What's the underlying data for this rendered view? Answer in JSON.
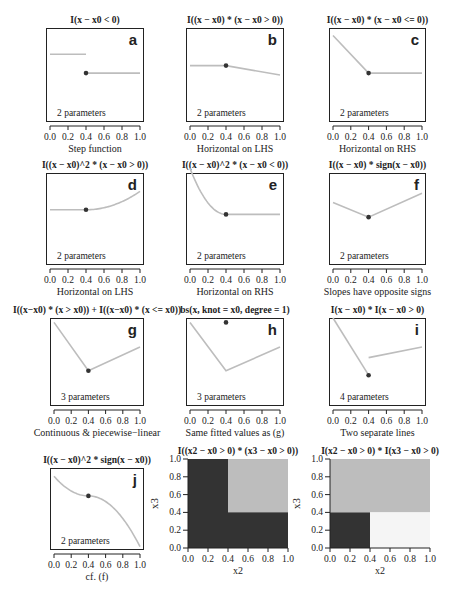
{
  "chart_data": [
    {
      "id": "a",
      "type": "line",
      "title": "I(x − x0 < 0)",
      "letter": "a",
      "params": "2 parameters",
      "xlabel": "Step function",
      "segments": [
        [
          [
            0.0,
            0.72
          ],
          [
            0.4,
            0.72
          ]
        ],
        [
          [
            0.4,
            0.52
          ],
          [
            1.0,
            0.52
          ]
        ]
      ],
      "knot": [
        0.4,
        0.52
      ],
      "xticks": [
        "0.0",
        "0.2",
        "0.4",
        "0.6",
        "0.8",
        "1.0"
      ],
      "xlim": [
        0,
        1
      ]
    },
    {
      "id": "b",
      "type": "line",
      "title": "I((x − x0) * (x − x0 > 0))",
      "letter": "b",
      "params": "2 parameters",
      "xlabel": "Horizontal on LHS",
      "segments": [
        [
          [
            0.0,
            0.6
          ],
          [
            0.4,
            0.6
          ],
          [
            1.0,
            0.5
          ]
        ]
      ],
      "knot": [
        0.4,
        0.6
      ],
      "xticks": [
        "0.0",
        "0.2",
        "0.4",
        "0.6",
        "0.8",
        "1.0"
      ],
      "xlim": [
        0,
        1
      ]
    },
    {
      "id": "c",
      "type": "line",
      "title": "I((x − x0) * (x − x0 <= 0))",
      "letter": "c",
      "params": "2 parameters",
      "xlabel": "Horizontal on RHS",
      "segments": [
        [
          [
            0.0,
            0.92
          ],
          [
            0.4,
            0.52
          ],
          [
            1.0,
            0.52
          ]
        ]
      ],
      "knot": [
        0.4,
        0.52
      ],
      "xticks": [
        "0.0",
        "0.2",
        "0.4",
        "0.6",
        "0.8",
        "1.0"
      ],
      "xlim": [
        0,
        1
      ]
    },
    {
      "id": "d",
      "type": "line",
      "title": "I((x − x0)^2 * (x − x0 > 0))",
      "letter": "d",
      "params": "2 parameters",
      "xlabel": "Horizontal on LHS",
      "curve": "quad_right",
      "knot": [
        0.4,
        0.6
      ],
      "end_y": 0.8,
      "xticks": [
        "0.0",
        "0.2",
        "0.4",
        "0.6",
        "0.8",
        "1.0"
      ],
      "xlim": [
        0,
        1
      ]
    },
    {
      "id": "e",
      "type": "line",
      "title": "I((x − x0)^2 * (x − x0 < 0))",
      "letter": "e",
      "params": "2 parameters",
      "xlabel": "Horizontal on RHS",
      "curve": "quad_left",
      "knot": [
        0.4,
        0.55
      ],
      "start_y": 1.05,
      "xticks": [
        "0.0",
        "0.2",
        "0.4",
        "0.6",
        "0.8",
        "1.0"
      ],
      "xlim": [
        0,
        1
      ]
    },
    {
      "id": "f",
      "type": "line",
      "title": "I((x − x0) * sign(x − x0))",
      "letter": "f",
      "params": "2 parameters",
      "xlabel": "Slopes have opposite signs",
      "segments": [
        [
          [
            0.0,
            0.68
          ],
          [
            0.4,
            0.52
          ],
          [
            1.0,
            0.78
          ]
        ]
      ],
      "knot": [
        0.4,
        0.52
      ],
      "xticks": [
        "0.0",
        "0.2",
        "0.4",
        "0.6",
        "0.8",
        "1.0"
      ],
      "xlim": [
        0,
        1
      ]
    },
    {
      "id": "g",
      "type": "line",
      "title": "I((x−x0) * (x >  x0)) + I((x−x0) * (x <= x0))",
      "letter": "g",
      "params": "3 parameters",
      "xlabel": "Continuous & piecewise−linear",
      "segments": [
        [
          [
            0.0,
            0.95
          ],
          [
            0.4,
            0.4
          ],
          [
            1.0,
            0.67
          ]
        ]
      ],
      "knot": [
        0.4,
        0.4
      ],
      "xticks": [
        "0.0",
        "0.2",
        "0.4",
        "0.6",
        "0.8",
        "1.0"
      ],
      "xlim": [
        0,
        1
      ]
    },
    {
      "id": "h",
      "type": "line",
      "title": "bs(x, knot = x0, degree = 1)",
      "letter": "h",
      "params": "3 parameters",
      "xlabel": "Same fitted values as (g)",
      "segments": [
        [
          [
            0.0,
            0.95
          ],
          [
            0.4,
            0.4
          ],
          [
            1.0,
            0.67
          ]
        ]
      ],
      "knot": [
        0.4,
        0.95
      ],
      "xticks": [
        "0.0",
        "0.2",
        "0.4",
        "0.6",
        "0.8",
        "1.0"
      ],
      "xlim": [
        0,
        1
      ]
    },
    {
      "id": "i",
      "type": "line",
      "title": "I(x − x0) * I(x − x0 > 0)",
      "letter": "i",
      "params": "4 parameters",
      "xlabel": "Two separate lines",
      "segments": [
        [
          [
            0.0,
            1.0
          ],
          [
            0.4,
            0.35
          ]
        ],
        [
          [
            0.4,
            0.55
          ],
          [
            1.0,
            0.67
          ]
        ]
      ],
      "knot": [
        0.4,
        0.35
      ],
      "xticks": [
        "0.0",
        "0.2",
        "0.4",
        "0.6",
        "0.8",
        "1.0"
      ],
      "xlim": [
        0,
        1
      ]
    },
    {
      "id": "j",
      "type": "line",
      "title": "I((x − x0)^2 * sign(x − x0))",
      "letter": "j",
      "params": "2 parameters",
      "xlabel": "cf. (f)",
      "curve": "signed_quad",
      "knot": [
        0.4,
        0.66
      ],
      "start_y": 0.9,
      "end_y": 0.04,
      "xticks": [
        "0.0",
        "0.2",
        "0.4",
        "0.6",
        "0.8",
        "1.0"
      ],
      "xlim": [
        0,
        1
      ]
    },
    {
      "id": "k",
      "type": "heatmap",
      "title": "I((x2 − x0 > 0) * (x3 − x0 > 0))",
      "letter": "k",
      "xlabel": "x2",
      "ylabel": "x3",
      "regions": [
        {
          "x": [
            0,
            1
          ],
          "y": [
            0,
            1
          ],
          "color": "#333333"
        },
        {
          "x": [
            0.4,
            1
          ],
          "y": [
            0.4,
            1
          ],
          "color": "#bdbdbd"
        }
      ],
      "xticks": [
        "0.0",
        "0.2",
        "0.4",
        "0.6",
        "0.8",
        "1.0"
      ],
      "yticks": [
        "0.0",
        "0.2",
        "0.4",
        "0.6",
        "0.8",
        "1.0"
      ]
    },
    {
      "id": "l",
      "type": "heatmap",
      "title": "I(x2 − x0 > 0) * I(x3 − x0 > 0)",
      "letter": "l",
      "xlabel": "x2",
      "ylabel": "x3",
      "regions": [
        {
          "x": [
            0,
            1
          ],
          "y": [
            0.4,
            1
          ],
          "color": "#bdbdbd"
        },
        {
          "x": [
            0,
            0.4
          ],
          "y": [
            0,
            0.4
          ],
          "color": "#333333"
        },
        {
          "x": [
            0.4,
            1
          ],
          "y": [
            0,
            0.4
          ],
          "color": "#f5f5f5"
        }
      ],
      "xticks": [
        "0.0",
        "0.2",
        "0.4",
        "0.6",
        "0.8",
        "1.0"
      ],
      "yticks": [
        "0.0",
        "0.2",
        "0.4",
        "0.6",
        "0.8",
        "1.0"
      ]
    }
  ],
  "colors": {
    "line": "#bdbdbd",
    "knot": "#333333",
    "axis": "#222222"
  }
}
